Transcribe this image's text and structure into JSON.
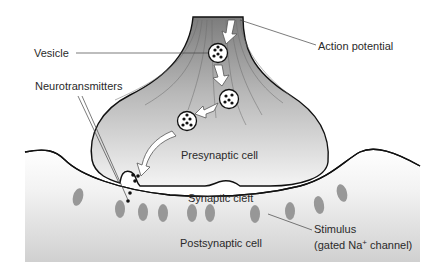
{
  "diagram": {
    "type": "synapse",
    "labels": {
      "vesicle": "Vesicle",
      "action_potential": "Action potential",
      "neurotransmitters": "Neurotransmitters",
      "presynaptic_cell": "Presynaptic cell",
      "synaptic_cleft": "Synaptic cleft",
      "postsynaptic_cell": "Postsynaptic cell",
      "stimulus": "Stimulus",
      "gated_channel_prefix": "(gated Na",
      "gated_channel_sup": "+",
      "gated_channel_suffix": " channel)"
    },
    "colors": {
      "cell_fill_dark": "#8a8a8a",
      "cell_fill_light": "#f2f2f2",
      "outline": "#111111",
      "channel": "#8f8f8f",
      "label_text": "#2a2a2a",
      "leader_line": "#444444"
    },
    "vesicles": [
      {
        "cx": 218,
        "cy": 53
      },
      {
        "cx": 229,
        "cy": 99
      },
      {
        "cx": 187,
        "cy": 121
      }
    ],
    "channels": [
      {
        "cx": 78,
        "cy": 197
      },
      {
        "cx": 120,
        "cy": 209
      },
      {
        "cx": 143,
        "cy": 212
      },
      {
        "cx": 163,
        "cy": 213
      },
      {
        "cx": 192,
        "cy": 213
      },
      {
        "cx": 210,
        "cy": 213
      },
      {
        "cx": 255,
        "cy": 214
      },
      {
        "cx": 290,
        "cy": 211
      },
      {
        "cx": 319,
        "cy": 205
      },
      {
        "cx": 342,
        "cy": 193
      }
    ]
  }
}
